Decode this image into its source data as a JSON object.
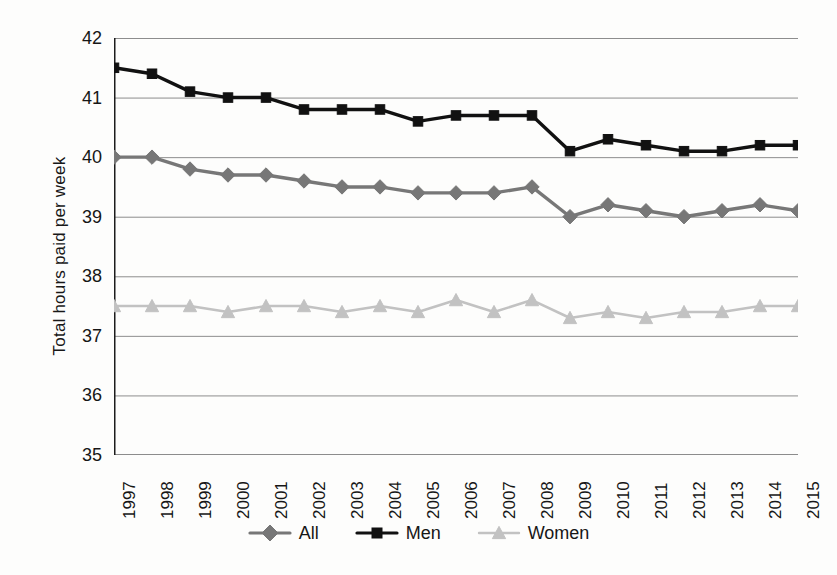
{
  "chart_data": {
    "type": "line",
    "title": "",
    "xlabel": "",
    "ylabel": "Total hours paid per week",
    "ylim": [
      35,
      42
    ],
    "yticks": [
      42,
      41,
      40,
      39,
      38,
      37,
      36,
      35
    ],
    "grid": "horizontal",
    "legend_position": "bottom-center",
    "categories": [
      "1997",
      "1998",
      "1999",
      "2000",
      "2001",
      "2002",
      "2003",
      "2004",
      "2005",
      "2006",
      "2007",
      "2008",
      "2009",
      "2010",
      "2011",
      "2012",
      "2013",
      "2014",
      "2015"
    ],
    "series": [
      {
        "name": "All",
        "marker": "diamond",
        "color": "#777777",
        "values": [
          40.0,
          40.0,
          39.8,
          39.7,
          39.7,
          39.6,
          39.5,
          39.5,
          39.4,
          39.4,
          39.4,
          39.5,
          39.0,
          39.2,
          39.1,
          39.0,
          39.1,
          39.2,
          39.1
        ]
      },
      {
        "name": "Men",
        "marker": "square",
        "color": "#111111",
        "values": [
          41.5,
          41.4,
          41.1,
          41.0,
          41.0,
          40.8,
          40.8,
          40.8,
          40.6,
          40.7,
          40.7,
          40.7,
          40.1,
          40.3,
          40.2,
          40.1,
          40.1,
          40.2,
          40.2
        ]
      },
      {
        "name": "Women",
        "marker": "triangle",
        "color": "#c2c2c2",
        "values": [
          37.5,
          37.5,
          37.5,
          37.4,
          37.5,
          37.5,
          37.4,
          37.5,
          37.4,
          37.6,
          37.4,
          37.6,
          37.3,
          37.4,
          37.3,
          37.4,
          37.4,
          37.5,
          37.5
        ]
      }
    ]
  },
  "axis": {
    "y_title": "Total hours paid per week",
    "y_tick_labels": [
      "42",
      "41",
      "40",
      "39",
      "38",
      "37",
      "36",
      "35"
    ],
    "x_tick_labels": [
      "1997",
      "1998",
      "1999",
      "2000",
      "2001",
      "2002",
      "2003",
      "2004",
      "2005",
      "2006",
      "2007",
      "2008",
      "2009",
      "2010",
      "2011",
      "2012",
      "2013",
      "2014",
      "2015"
    ]
  },
  "legend": {
    "entries": [
      {
        "label": "All",
        "color": "#777777",
        "marker": "diamond"
      },
      {
        "label": "Men",
        "color": "#111111",
        "marker": "square"
      },
      {
        "label": "Women",
        "color": "#c2c2c2",
        "marker": "triangle"
      }
    ]
  },
  "caption": {
    "text": ""
  },
  "colors": {
    "background": "#fdfdfc",
    "grid": "#8d8d8d",
    "axis": "#1c1c1c",
    "all": "#777777",
    "men": "#111111",
    "women": "#c2c2c2"
  }
}
